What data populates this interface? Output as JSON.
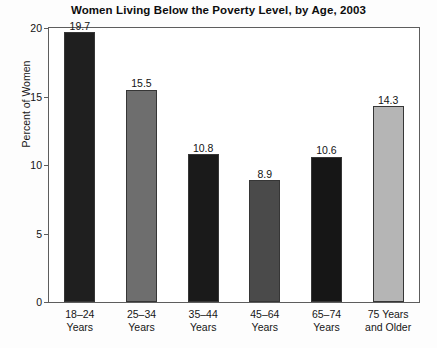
{
  "chart_data": {
    "type": "bar",
    "title": "Women Living Below the Poverty Level, by Age, 2003",
    "subtitle": "",
    "xlabel": "",
    "ylabel": "Percent of Women",
    "categories": [
      "18–24 Years",
      "25–34 Years",
      "35–44 Years",
      "45–64 Years",
      "65–74 Years",
      "75 Years and Older"
    ],
    "category_lines": [
      [
        "18–24",
        "Years"
      ],
      [
        "25–34",
        "Years"
      ],
      [
        "35–44",
        "Years"
      ],
      [
        "45–64",
        "Years"
      ],
      [
        "65–74",
        "Years"
      ],
      [
        "75 Years",
        "and Older"
      ]
    ],
    "values": [
      19.7,
      15.5,
      10.8,
      8.9,
      10.6,
      14.3
    ],
    "value_labels": [
      "19.7",
      "15.5",
      "10.8",
      "8.9",
      "10.6",
      "14.3"
    ],
    "bar_colors": [
      "#1f1f1f",
      "#6e6e6e",
      "#1a1a1a",
      "#4a4a4a",
      "#161616",
      "#b5b5b5"
    ],
    "bar_edge_color": "#363636",
    "ylim": [
      0,
      20
    ],
    "yticks": [
      0,
      5,
      10,
      15,
      20
    ],
    "ytick_labels": [
      "0",
      "5",
      "10",
      "15",
      "20"
    ],
    "grid": false,
    "legend": null,
    "legend_position": "none",
    "axis_color": "#5d5d5d",
    "background_color": "#fdfdfd",
    "plot_background_color": "#ffffff"
  }
}
